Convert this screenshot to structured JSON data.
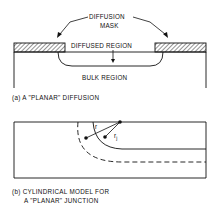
{
  "figure_a": {
    "labels": {
      "mask_line1": "DIFFUSION",
      "mask_line2": "MASK",
      "diffused": "DIFFUSED REGION",
      "bulk": "BULK REGION"
    },
    "caption": "(a) A \"PLANAR\" DIFFUSION"
  },
  "figure_b": {
    "labels": {
      "r": "r",
      "rj": "r",
      "rj_sub": "j"
    },
    "caption_line1": "(b) CYLINDRICAL MODEL FOR",
    "caption_line2": "A \"PLANAR\" JUNCTION"
  },
  "colors": {
    "ink": "#111111",
    "background": "#ffffff"
  }
}
